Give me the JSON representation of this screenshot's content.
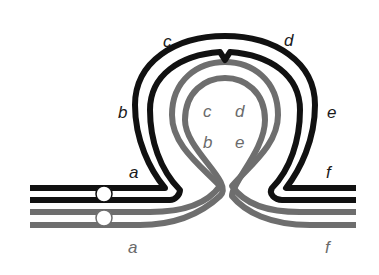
{
  "diagram": {
    "title": "",
    "colors": {
      "black_track": "#111111",
      "gray_track": "#6e6e6e",
      "background": "#ffffff",
      "marker_fill": "#ffffff"
    },
    "outer_labels": {
      "a": "a",
      "b": "b",
      "c": "c",
      "d": "d",
      "e": "e",
      "f": "f"
    },
    "inner_labels": {
      "c": "c",
      "d": "d",
      "b": "b",
      "e": "e"
    },
    "bottom_labels": {
      "a": "a",
      "f": "f"
    },
    "tracks": [
      {
        "name": "black-outer",
        "color": "black"
      },
      {
        "name": "black-inner",
        "color": "black"
      },
      {
        "name": "gray-outer",
        "color": "gray"
      },
      {
        "name": "gray-inner",
        "color": "gray"
      }
    ],
    "markers": [
      {
        "name": "marker-black",
        "track": "black"
      },
      {
        "name": "marker-gray",
        "track": "gray"
      }
    ]
  }
}
